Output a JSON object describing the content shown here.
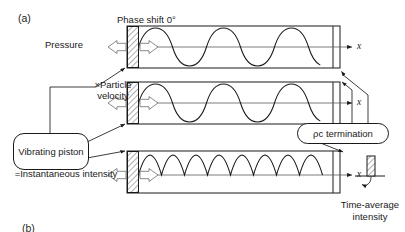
{
  "figure": {
    "panel_label": "(a)",
    "panel_label_next": "(b)",
    "phase_shift_label": "Phase shift 0°",
    "source_label": "Vibrating piston",
    "termination_label": "ρc termination",
    "time_average_label": "Time-average intensity",
    "axis_label": "x"
  },
  "rows": [
    {
      "id": "pressure",
      "label": "Pressure",
      "wave": "sine",
      "cycles": 2.5,
      "phase_deg": 0,
      "rectified": false
    },
    {
      "id": "particle-velocity",
      "label": "×Particle velocity",
      "wave": "sine",
      "cycles": 2.5,
      "phase_deg": 0,
      "rectified": false
    },
    {
      "id": "instantaneous-intensity",
      "label": "=Instantaneous intensity",
      "wave": "rectified-sine",
      "cycles": 5,
      "phase_deg": 0,
      "rectified": true
    }
  ],
  "colors": {
    "stroke": "#1a1a1a",
    "axis": "#5a5a5a",
    "arrow_outline": "#7d7d7d",
    "background": "#ffffff"
  }
}
